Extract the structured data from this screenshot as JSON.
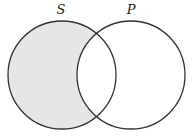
{
  "diagram": {
    "type": "venn",
    "sets": [
      {
        "label": "S",
        "cx": 62,
        "cy": 75,
        "r": 54
      },
      {
        "label": "P",
        "cx": 131,
        "cy": 75,
        "r": 54
      }
    ],
    "shaded_region": "S minus P",
    "shade_color": "#e6e6e6",
    "stroke_color": "#333333"
  }
}
